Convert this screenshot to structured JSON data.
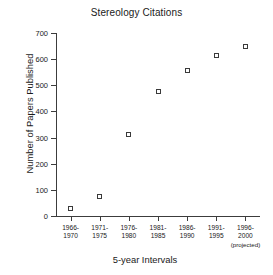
{
  "chart_data": {
    "type": "scatter",
    "title": "Stereology Citations",
    "xlabel": "5-year Intervals",
    "ylabel": "Number of Papers Published",
    "categories": [
      "1966-\n1970",
      "1971-\n1975",
      "1976-\n1980",
      "1981-\n1985",
      "1986-\n1990",
      "1991-\n1995",
      "1996-\n2000"
    ],
    "category_notes": [
      "",
      "",
      "",
      "",
      "",
      "",
      "(projected)"
    ],
    "values": [
      30,
      75,
      310,
      475,
      557,
      615,
      650
    ],
    "ylim": [
      0,
      700
    ],
    "yticks": [
      0,
      100,
      200,
      300,
      400,
      500,
      600,
      700
    ],
    "ytick_labels": [
      "0",
      "100",
      "200",
      "300",
      "400",
      "500",
      "600",
      "700"
    ],
    "grid": false,
    "legend": null,
    "marker": "open-square",
    "marker_color": "#3a3a3a",
    "axis_color": "#3c3c3c",
    "background": "#ffffff"
  }
}
